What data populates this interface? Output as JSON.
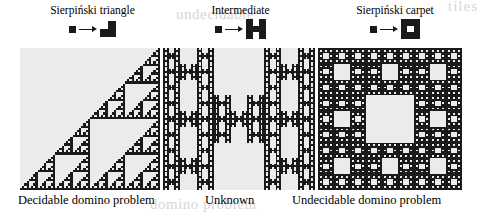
{
  "figure": {
    "background_color": "#ffffff",
    "panel_background_color": "#ebebeb",
    "ink_color": "#1a1a1a",
    "watermark_color": "#d8d6d2"
  },
  "watermarks": {
    "top_right": "tiles",
    "middle": "undecidable",
    "bottom": "domino problem"
  },
  "legends": [
    {
      "title": "Sierpiński triangle",
      "seed_icon": "filled-square-icon",
      "arrow_icon": "right-arrow-icon",
      "generator": {
        "size": 2,
        "cells": [
          [
            0,
            1
          ],
          [
            1,
            1
          ],
          [
            1,
            0
          ]
        ],
        "filled_count": 3,
        "grid": [
          [
            0,
            1
          ],
          [
            1,
            1
          ]
        ]
      }
    },
    {
      "title": "Intermediate",
      "seed_icon": "filled-square-icon",
      "arrow_icon": "right-arrow-icon",
      "generator": {
        "size": 3,
        "filled_count": 7,
        "grid": [
          [
            1,
            0,
            1
          ],
          [
            1,
            1,
            1
          ],
          [
            1,
            0,
            1
          ]
        ]
      }
    },
    {
      "title": "Sierpiński carpet",
      "seed_icon": "filled-square-icon",
      "arrow_icon": "right-arrow-icon",
      "generator": {
        "size": 3,
        "filled_count": 8,
        "grid": [
          [
            1,
            1,
            1
          ],
          [
            1,
            0,
            1
          ],
          [
            1,
            1,
            1
          ]
        ]
      }
    }
  ],
  "panels": [
    {
      "name": "sierpinski-triangle-fractal",
      "fractal_type": "sierpinski-triangle",
      "iterations": 6,
      "orientation": "lower-right"
    },
    {
      "name": "intermediate-h-fractal",
      "fractal_type": "intermediate-h",
      "iterations": 4
    },
    {
      "name": "sierpinski-carpet-fractal",
      "fractal_type": "sierpinski-carpet",
      "iterations": 4
    }
  ],
  "captions": [
    "Decidable domino problem",
    "Unknown",
    "Undecidable domino problem"
  ]
}
